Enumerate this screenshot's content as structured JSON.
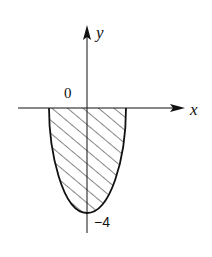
{
  "diagram": {
    "type": "shaded-region-parabola",
    "axes": {
      "x_label": "x",
      "y_label": "y",
      "origin_label": "0"
    },
    "curve": {
      "equation_hint": "parabola opening upward with vertex below origin",
      "vertex_label": "−4"
    },
    "region": {
      "description": "area between parabola and x-axis, below x-axis, hatched",
      "fill_pattern": "diagonal-hatch"
    },
    "colors": {
      "stroke": "#111111",
      "background": "#ffffff"
    }
  }
}
